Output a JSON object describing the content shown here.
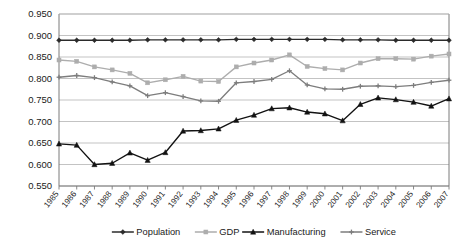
{
  "chart_data": {
    "type": "line",
    "title": "",
    "subtitle": "",
    "xlabel": "",
    "ylabel": "",
    "grid": true,
    "legend_position": "bottom",
    "ylim": [
      0.55,
      0.95
    ],
    "ytick_step": 0.05,
    "ytick_labels": [
      "0.950",
      "0.900",
      "0.850",
      "0.800",
      "0.750",
      "0.700",
      "0.650",
      "0.600",
      "0.550"
    ],
    "ytick_values": [
      0.95,
      0.9,
      0.85,
      0.8,
      0.75,
      0.7,
      0.65,
      0.6,
      0.55
    ],
    "categories": [
      "1985",
      "1986",
      "1987",
      "1988",
      "1989",
      "1990",
      "1991",
      "1992",
      "1993",
      "1994",
      "1995",
      "1996",
      "1997",
      "1998",
      "1999",
      "2000",
      "2001",
      "2002",
      "2003",
      "2004",
      "2005",
      "2006",
      "2007"
    ],
    "series": [
      {
        "name": "Population",
        "color": "#2b2b2b",
        "marker": "diamond",
        "values": [
          0.889,
          0.889,
          0.889,
          0.889,
          0.889,
          0.89,
          0.89,
          0.89,
          0.89,
          0.89,
          0.891,
          0.891,
          0.891,
          0.891,
          0.891,
          0.891,
          0.89,
          0.89,
          0.89,
          0.889,
          0.889,
          0.889,
          0.889
        ]
      },
      {
        "name": "GDP",
        "color": "#adadad",
        "marker": "square",
        "values": [
          0.843,
          0.84,
          0.827,
          0.82,
          0.812,
          0.79,
          0.797,
          0.805,
          0.794,
          0.793,
          0.827,
          0.836,
          0.843,
          0.855,
          0.828,
          0.823,
          0.82,
          0.836,
          0.846,
          0.846,
          0.845,
          0.852,
          0.857
        ]
      },
      {
        "name": "Manufacturing",
        "color": "#121212",
        "marker": "triangle",
        "values": [
          0.648,
          0.645,
          0.6,
          0.603,
          0.627,
          0.61,
          0.628,
          0.678,
          0.679,
          0.683,
          0.703,
          0.715,
          0.73,
          0.732,
          0.722,
          0.718,
          0.702,
          0.74,
          0.755,
          0.751,
          0.745,
          0.736,
          0.753
        ]
      },
      {
        "name": "Service",
        "color": "#7d7d7d",
        "marker": "cross",
        "values": [
          0.803,
          0.807,
          0.802,
          0.792,
          0.783,
          0.76,
          0.767,
          0.758,
          0.748,
          0.747,
          0.79,
          0.793,
          0.798,
          0.818,
          0.785,
          0.776,
          0.775,
          0.782,
          0.783,
          0.781,
          0.784,
          0.791,
          0.796
        ]
      }
    ]
  },
  "legend": {
    "items": [
      {
        "label": "Population"
      },
      {
        "label": "GDP"
      },
      {
        "label": "Manufacturing"
      },
      {
        "label": "Service"
      }
    ]
  }
}
